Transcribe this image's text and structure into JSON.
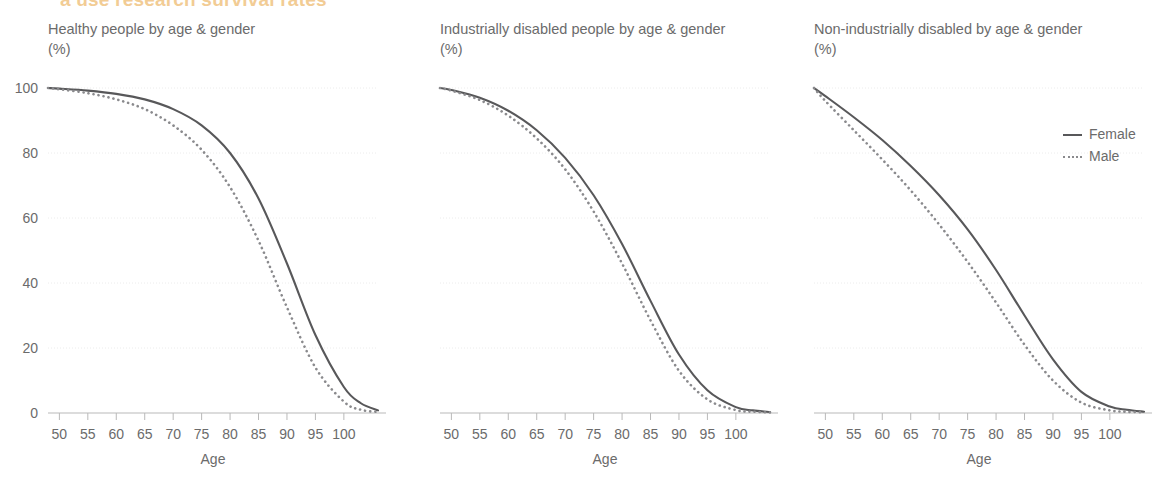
{
  "figure": {
    "cut_off_headline": "a use research survival rates",
    "background_color": "#ffffff",
    "text_color": "#6b6b6b",
    "female_color": "#58585a",
    "male_color": "#8a8a8d",
    "grid_color": "#ececec"
  },
  "legend": {
    "position": "right",
    "entries": [
      {
        "label": "Female",
        "style": "solid",
        "color": "#58585a",
        "swatch": "solid-line-swatch"
      },
      {
        "label": "Male",
        "style": "dotted",
        "color": "#8a8a8d",
        "swatch": "dotted-line-swatch"
      }
    ]
  },
  "panels": [
    {
      "title": "Healthy people by age & gender",
      "unit": "(%)",
      "xlabel": "Age"
    },
    {
      "title": "Industrially disabled people by age & gender",
      "unit": "(%)",
      "xlabel": "Age"
    },
    {
      "title": "Non-industrially disabled by age & gender",
      "unit": "(%)",
      "xlabel": "Age"
    }
  ],
  "chart_data": [
    {
      "type": "line",
      "title": "Healthy people by age & gender",
      "xlabel": "Age",
      "ylabel": "(%)",
      "xlim": [
        48,
        106
      ],
      "ylim": [
        0,
        100
      ],
      "xticks": [
        50,
        55,
        60,
        65,
        70,
        75,
        80,
        85,
        90,
        95,
        100
      ],
      "yticks": [
        0,
        20,
        40,
        60,
        80,
        100
      ],
      "grid": true,
      "x": [
        48,
        50,
        55,
        60,
        65,
        70,
        75,
        80,
        85,
        90,
        95,
        100,
        103,
        106
      ],
      "series": [
        {
          "name": "Female",
          "style": "solid",
          "values": [
            100,
            99.8,
            99.2,
            98.2,
            96.5,
            93.5,
            88.5,
            80.0,
            66.0,
            46.0,
            24.0,
            8.0,
            3.0,
            0.8
          ]
        },
        {
          "name": "Male",
          "style": "dotted",
          "values": [
            100,
            99.6,
            98.4,
            96.5,
            93.5,
            88.5,
            81.0,
            69.5,
            53.0,
            32.5,
            14.0,
            3.5,
            1.0,
            0.3
          ]
        }
      ]
    },
    {
      "type": "line",
      "title": "Industrially disabled people by age & gender",
      "xlabel": "Age",
      "ylabel": "(%)",
      "xlim": [
        48,
        106
      ],
      "ylim": [
        0,
        100
      ],
      "xticks": [
        50,
        55,
        60,
        65,
        70,
        75,
        80,
        85,
        90,
        95,
        100
      ],
      "yticks": [
        0,
        20,
        40,
        60,
        80,
        100
      ],
      "grid": true,
      "x": [
        48,
        50,
        55,
        60,
        65,
        70,
        75,
        80,
        85,
        90,
        95,
        100,
        103,
        106
      ],
      "series": [
        {
          "name": "Female",
          "style": "solid",
          "values": [
            100,
            99.4,
            97.0,
            93.0,
            87.0,
            78.5,
            67.0,
            52.0,
            34.5,
            18.0,
            7.0,
            1.8,
            0.8,
            0.3
          ]
        },
        {
          "name": "Male",
          "style": "dotted",
          "values": [
            100,
            99.2,
            96.3,
            91.5,
            84.5,
            75.0,
            62.0,
            46.0,
            28.5,
            13.0,
            4.2,
            0.9,
            0.4,
            0.2
          ]
        }
      ]
    },
    {
      "type": "line",
      "title": "Non-industrially disabled by age & gender",
      "xlabel": "Age",
      "ylabel": "(%)",
      "xlim": [
        48,
        106
      ],
      "ylim": [
        0,
        100
      ],
      "xticks": [
        50,
        55,
        60,
        65,
        70,
        75,
        80,
        85,
        90,
        95,
        100
      ],
      "yticks": [
        0,
        20,
        40,
        60,
        80,
        100
      ],
      "grid": true,
      "x": [
        48,
        50,
        55,
        60,
        65,
        70,
        75,
        80,
        85,
        90,
        95,
        100,
        103,
        106
      ],
      "series": [
        {
          "name": "Female",
          "style": "solid",
          "values": [
            100,
            97.5,
            91.0,
            84.0,
            76.0,
            67.0,
            56.5,
            44.0,
            30.0,
            16.5,
            6.5,
            2.0,
            1.0,
            0.4
          ]
        },
        {
          "name": "Male",
          "style": "dotted",
          "values": [
            100,
            96.0,
            87.0,
            78.0,
            68.5,
            58.0,
            46.5,
            34.0,
            21.0,
            10.0,
            3.2,
            0.8,
            0.4,
            0.2
          ]
        }
      ]
    }
  ]
}
